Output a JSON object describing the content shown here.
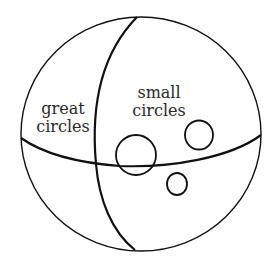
{
  "diagram": {
    "labels": {
      "great_circles": [
        "great",
        "circles"
      ],
      "small_circles": [
        "small",
        "circles"
      ]
    },
    "colors": {
      "stroke": "#111111",
      "text": "#2a2a2a",
      "background": "#ffffff"
    }
  }
}
